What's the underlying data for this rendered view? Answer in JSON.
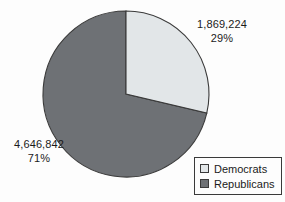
{
  "chart_data": {
    "type": "pie",
    "title": "",
    "labels": [
      "Democrats",
      "Republicans"
    ],
    "values": [
      1869224,
      4646842
    ],
    "value_labels": [
      "1,869,224",
      "4,646,842"
    ],
    "percents": [
      29,
      71
    ],
    "percent_labels": [
      "29%",
      "71%"
    ],
    "colors": [
      "#e2e6e8",
      "#6e7175"
    ],
    "start_angle_deg": 0,
    "direction": "clockwise",
    "legend_position": "bottom-right",
    "grid": false,
    "background": "#fdfdfd",
    "outline_color": "#3a3a3a"
  },
  "labels": {
    "democrats": {
      "value": "1,869,224",
      "percent": "29%"
    },
    "republicans": {
      "value": "4,646,842",
      "percent": "71%"
    }
  },
  "legend": {
    "entries": [
      {
        "label": "Democrats",
        "color": "#e2e6e8"
      },
      {
        "label": "Republicans",
        "color": "#6e7175"
      }
    ]
  }
}
